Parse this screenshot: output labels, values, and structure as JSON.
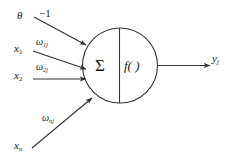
{
  "diagram": {
    "background_color": "#ffffff",
    "stroke_color": "#333333",
    "text_color": "#1a1a1a",
    "body": {
      "summation_symbol": "Σ",
      "activation_function": "f( )"
    },
    "inputs": [
      {
        "id": "bias",
        "signal": "θ",
        "weight": "−1",
        "weight_base": "−1",
        "weight_sub": ""
      },
      {
        "id": "x1",
        "signal": "x",
        "signal_sub": "1",
        "weight_base": "ω",
        "weight_sub": "1j"
      },
      {
        "id": "x2",
        "signal": "x",
        "signal_sub": "2",
        "weight_base": "ω",
        "weight_sub": "2j"
      },
      {
        "id": "xn",
        "signal": "x",
        "signal_sub": "n",
        "weight_base": "ω",
        "weight_sub": "nj"
      }
    ],
    "output": {
      "base": "y",
      "sub": "j"
    },
    "labels": {
      "theta": "θ",
      "minus_one": "−1",
      "x_base": "x",
      "x1_sub": "1",
      "x2_sub": "2",
      "xn_sub": "n",
      "omega": "ω",
      "w1j_sub": "1j",
      "w2j_sub": "2j",
      "wnj_sub": "nj",
      "sigma": "Σ",
      "f_of": "f( )",
      "y_base": "y",
      "y_sub": "j"
    }
  }
}
